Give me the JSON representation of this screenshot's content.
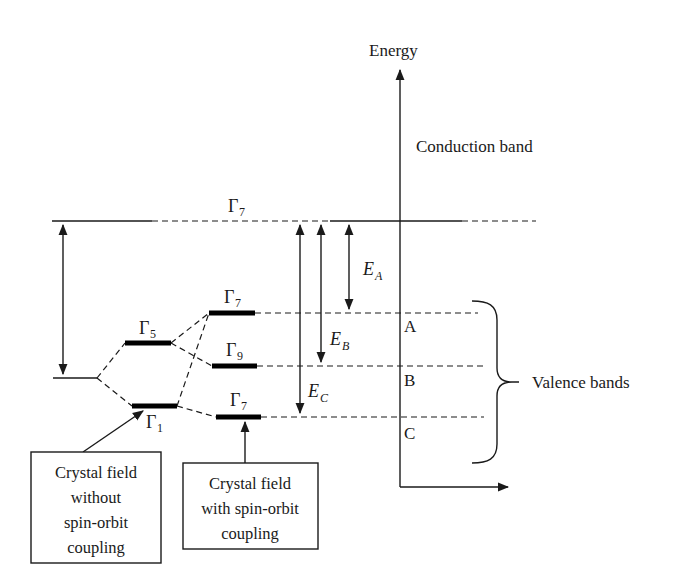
{
  "diagram": {
    "type": "energy-level-diagram",
    "axis": {
      "y_label": "Energy"
    },
    "regions": {
      "conduction": "Conduction band",
      "valence": "Valence bands"
    },
    "levels": {
      "conduction_top": {
        "symbol": "Γ",
        "subscript": "7"
      },
      "crystal_field_upper": {
        "symbol": "Γ",
        "subscript": "5"
      },
      "crystal_field_lower": {
        "symbol": "Γ",
        "subscript": "1"
      },
      "so_upper": {
        "symbol": "Γ",
        "subscript": "7"
      },
      "so_middle": {
        "symbol": "Γ",
        "subscript": "9"
      },
      "so_lower": {
        "symbol": "Γ",
        "subscript": "7"
      }
    },
    "band_labels": [
      "A",
      "B",
      "C"
    ],
    "transitions": [
      {
        "symbol": "E",
        "subscript": "A"
      },
      {
        "symbol": "E",
        "subscript": "B"
      },
      {
        "symbol": "E",
        "subscript": "C"
      }
    ],
    "boxes": {
      "without_so": [
        "Crystal field",
        "without",
        "spin-orbit",
        "coupling"
      ],
      "with_so": [
        "Crystal field",
        "with spin-orbit",
        "coupling"
      ]
    }
  }
}
